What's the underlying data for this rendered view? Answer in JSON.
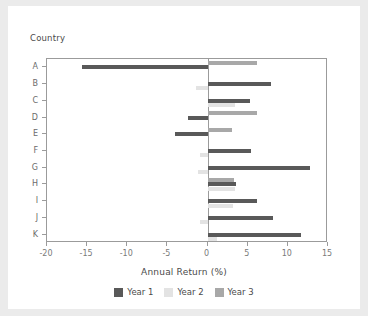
{
  "chart_data": {
    "type": "bar",
    "orientation": "horizontal",
    "title": "",
    "xlabel": "Annual Return (%)",
    "ylabel": "Country",
    "categories": [
      "A",
      "B",
      "C",
      "D",
      "E",
      "F",
      "G",
      "H",
      "I",
      "J",
      "K"
    ],
    "series": [
      {
        "name": "Year 1",
        "color": "#595959",
        "values": [
          -15.7,
          7.9,
          5.3,
          -2.4,
          -4.0,
          5.4,
          12.8,
          3.5,
          6.2,
          8.2,
          11.7
        ]
      },
      {
        "name": "Year 2",
        "color": "#e3e3e3",
        "values": [
          0.0,
          -1.5,
          3.4,
          0.0,
          0.0,
          -0.9,
          -1.2,
          3.4,
          3.2,
          -1.0,
          1.2
        ]
      },
      {
        "name": "Year 3",
        "color": "#a8a8a8",
        "values": [
          6.1,
          0.0,
          0.0,
          6.2,
          3.0,
          0.0,
          0.0,
          3.3,
          0.0,
          0.0,
          0.0
        ]
      }
    ],
    "xticks": [
      -20,
      -15,
      -10,
      -5,
      0,
      5,
      10,
      15
    ],
    "xticklabels": [
      "-20",
      "-15",
      "-10",
      "-5",
      "0",
      "5",
      "10",
      "15"
    ],
    "xlim": [
      -20,
      15
    ],
    "grid": false,
    "legend_position": "bottom",
    "zero_line": 0
  }
}
